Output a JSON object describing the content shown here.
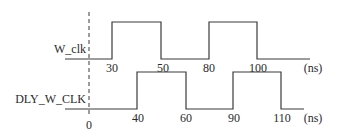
{
  "diagram": {
    "type": "timing",
    "unit_label": "(ns)",
    "reference_time_label": "0",
    "colors": {
      "line": "#3a3a3a",
      "text": "#2a2a2a",
      "background": "#ffffff"
    },
    "signals": [
      {
        "name": "W_clk",
        "edges": [
          {
            "time": 30,
            "label": "30",
            "direction": "rise"
          },
          {
            "time": 50,
            "label": "50",
            "direction": "fall"
          },
          {
            "time": 80,
            "label": "80",
            "direction": "rise"
          },
          {
            "time": 100,
            "label": "100",
            "direction": "fall"
          }
        ]
      },
      {
        "name": "DLY_W_CLK",
        "edges": [
          {
            "time": 40,
            "label": "40",
            "direction": "rise"
          },
          {
            "time": 60,
            "label": "60",
            "direction": "fall"
          },
          {
            "time": 90,
            "label": "90",
            "direction": "rise"
          },
          {
            "time": 110,
            "label": "110",
            "direction": "fall"
          }
        ]
      }
    ]
  }
}
